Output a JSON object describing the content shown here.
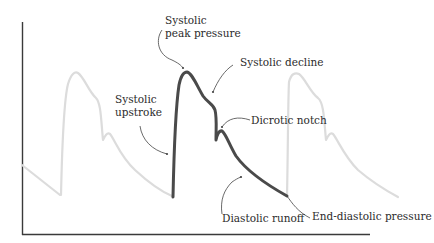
{
  "diagram": {
    "colors": {
      "axis": "#3a3a3a",
      "main_wave": "#4a4a4a",
      "ghost_wave": "#dcdcdc",
      "leader": "#444444",
      "text": "#2b2b2b"
    },
    "labels": {
      "systolic_peak": [
        "Systolic",
        "peak pressure"
      ],
      "systolic_decline": "Systolic decline",
      "systolic_upstroke": [
        "Systolic",
        "upstroke"
      ],
      "dicrotic_notch": "Dicrotic notch",
      "diastolic_runoff": "Diastolic runoff",
      "end_diastolic": "End-diastolic pressure"
    }
  }
}
